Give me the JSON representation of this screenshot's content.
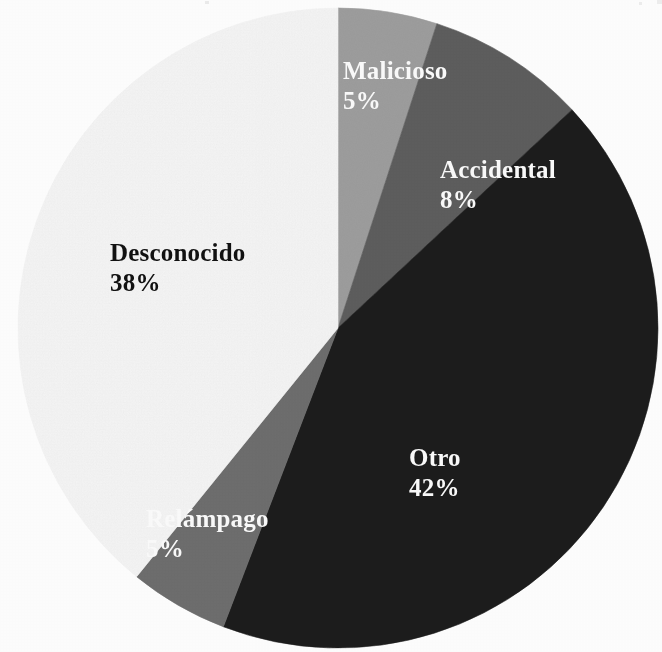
{
  "chart_data": {
    "type": "pie",
    "title": "",
    "subtitle": "",
    "xlabel": "",
    "ylabel": "",
    "legend_position": "none",
    "grid": false,
    "labels_inside_slices": true,
    "total_percent": 98,
    "start_angle_deg": 0,
    "direction": "clockwise",
    "categories": [
      "Malicioso",
      "Accidental",
      "Otro",
      "Relámpago",
      "Desconocido"
    ],
    "values": [
      5,
      8,
      42,
      5,
      38
    ],
    "value_suffix": "%",
    "colors": [
      "#9e9e9e",
      "#5e5e5e",
      "#1f1f1f",
      "#6e6e6e",
      "#f5f5f5"
    ],
    "slices": [
      {
        "label": "Malicioso",
        "value": 5,
        "value_text": "5%",
        "color": "#9e9e9e",
        "label_color": "#fafafa",
        "start_angle_deg": 0,
        "end_angle_deg": 18
      },
      {
        "label": "Accidental",
        "value": 8,
        "value_text": "8%",
        "color": "#5e5e5e",
        "label_color": "#fafafa",
        "start_angle_deg": 18,
        "end_angle_deg": 47
      },
      {
        "label": "Otro",
        "value": 42,
        "value_text": "42%",
        "color": "#1f1f1f",
        "label_color": "#fafafa",
        "start_angle_deg": 47,
        "end_angle_deg": 201
      },
      {
        "label": "Relámpago",
        "value": 5,
        "value_text": "5%",
        "color": "#6e6e6e",
        "label_color": "#fafafa",
        "start_angle_deg": 201,
        "end_angle_deg": 219
      },
      {
        "label": "Desconocido",
        "value": 38,
        "value_text": "38%",
        "color": "#f5f5f5",
        "label_color": "#111111",
        "start_angle_deg": 219,
        "end_angle_deg": 360
      }
    ]
  },
  "geometry": {
    "center_x": 338,
    "center_y": 328,
    "radius": 320
  },
  "labels": {
    "malicioso": {
      "name": "Malicioso",
      "value": "5%"
    },
    "accidental": {
      "name": "Accidental",
      "value": "8%"
    },
    "desconocido": {
      "name": "Desconocido",
      "value": "38%"
    },
    "otro": {
      "name": "Otro",
      "value": "42%"
    },
    "relampago": {
      "name": "Relámpago",
      "value": "5%"
    }
  }
}
